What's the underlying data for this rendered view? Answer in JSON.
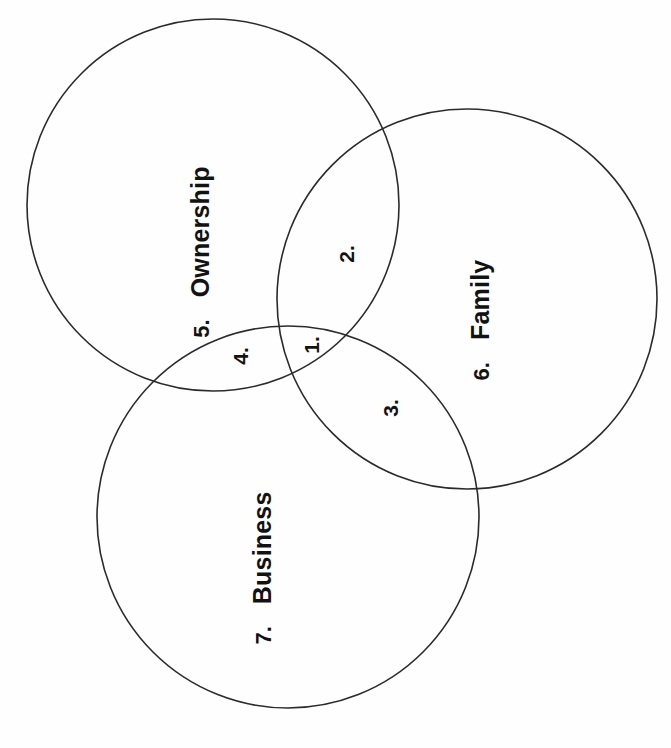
{
  "diagram": {
    "type": "venn-3-circle",
    "background_color": "#ffffff",
    "stroke_color": "#2b2b2b",
    "text_color": "#121212",
    "text_rotation_degrees": -90,
    "canvas": {
      "width": 671,
      "height": 748
    },
    "circles": [
      {
        "key": "ownership",
        "name": "Ownership",
        "number": "5.",
        "cx": 213,
        "cy": 205,
        "r": 186
      },
      {
        "key": "family",
        "name": "Family",
        "number": "6.",
        "cx": 467,
        "cy": 299,
        "r": 190
      },
      {
        "key": "business",
        "name": "Business",
        "number": "7.",
        "cx": 288,
        "cy": 517,
        "r": 191
      }
    ],
    "circle_labels": [
      {
        "number": "5.",
        "name": "Ownership",
        "x": 200,
        "y": 252
      },
      {
        "number": "6.",
        "name": "Family",
        "x": 480,
        "y": 320
      },
      {
        "number": "7.",
        "name": "Business",
        "x": 262,
        "y": 568
      }
    ],
    "intersection_labels": [
      {
        "number": "1.",
        "region": "ownership-family-business",
        "x": 311,
        "y": 345
      },
      {
        "number": "2.",
        "region": "ownership-family",
        "x": 346,
        "y": 254
      },
      {
        "number": "3.",
        "region": "family-business",
        "x": 390,
        "y": 408
      },
      {
        "number": "4.",
        "region": "ownership-business",
        "x": 240,
        "y": 356
      }
    ]
  }
}
